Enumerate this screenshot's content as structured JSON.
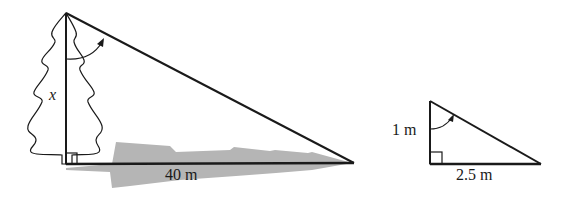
{
  "diagram": {
    "large_triangle": {
      "height_label": "x",
      "base_label": "40 m",
      "object": "tree",
      "shadow": true
    },
    "small_triangle": {
      "height_label": "1 m",
      "base_label": "2.5 m"
    },
    "colors": {
      "line": "#1a1a1a",
      "shadow": "#b5b5b5"
    }
  }
}
